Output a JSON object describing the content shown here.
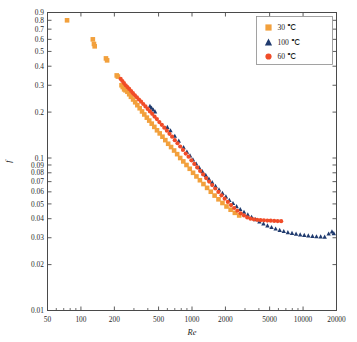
{
  "chart_data": {
    "type": "scatter",
    "title": "",
    "xlabel": "Re",
    "ylabel": "f",
    "xscale": "log",
    "yscale": "log",
    "xlim": [
      50,
      20000
    ],
    "ylim": [
      0.01,
      0.9
    ],
    "grid": false,
    "legend_position": "top-right",
    "xticks": [
      50,
      100,
      200,
      500,
      1000,
      2000,
      5000,
      10000,
      20000
    ],
    "xtick_labels": [
      "50",
      "100",
      "200",
      "500",
      "1000",
      "2000",
      "5000",
      "10000",
      "20000"
    ],
    "yticks": [
      0.01,
      0.02,
      0.03,
      0.04,
      0.05,
      0.06,
      0.07,
      0.08,
      0.09,
      0.1,
      0.2,
      0.3,
      0.4,
      0.5,
      0.6,
      0.7,
      0.8,
      0.9
    ],
    "ytick_labels": [
      "0.01",
      "0.02",
      "0.03",
      "0.04",
      "0.05",
      "0.06",
      "0.07",
      "0.08",
      "0.09",
      "0.1",
      "0.2",
      "0.3",
      "0.4",
      "0.5",
      "0.6",
      "0.7",
      "0.8",
      "0.9"
    ],
    "series": [
      {
        "name": "30 ℃",
        "marker": "square",
        "color": "#F2A03C",
        "points": [
          [
            75,
            0.8
          ],
          [
            128,
            0.6
          ],
          [
            131,
            0.56
          ],
          [
            133,
            0.54
          ],
          [
            168,
            0.45
          ],
          [
            172,
            0.437
          ],
          [
            210,
            0.348
          ],
          [
            215,
            0.342
          ],
          [
            232,
            0.3
          ],
          [
            238,
            0.292
          ],
          [
            245,
            0.282
          ],
          [
            252,
            0.278
          ],
          [
            262,
            0.272
          ],
          [
            272,
            0.262
          ],
          [
            282,
            0.252
          ],
          [
            295,
            0.242
          ],
          [
            308,
            0.232
          ],
          [
            322,
            0.222
          ],
          [
            338,
            0.212
          ],
          [
            355,
            0.202
          ],
          [
            372,
            0.193
          ],
          [
            392,
            0.184
          ],
          [
            412,
            0.176
          ],
          [
            434,
            0.168
          ],
          [
            458,
            0.16
          ],
          [
            484,
            0.152
          ],
          [
            512,
            0.145
          ],
          [
            542,
            0.138
          ],
          [
            575,
            0.131
          ],
          [
            610,
            0.124
          ],
          [
            648,
            0.118
          ],
          [
            690,
            0.112
          ],
          [
            735,
            0.106
          ],
          [
            783,
            0.1
          ],
          [
            835,
            0.095
          ],
          [
            892,
            0.09
          ],
          [
            954,
            0.085
          ],
          [
            1022,
            0.08
          ],
          [
            1096,
            0.0757
          ],
          [
            1178,
            0.0715
          ],
          [
            1268,
            0.0675
          ],
          [
            1367,
            0.0637
          ],
          [
            1477,
            0.0601
          ],
          [
            1598,
            0.0567
          ],
          [
            1732,
            0.0536
          ],
          [
            1880,
            0.0507
          ],
          [
            2045,
            0.0481
          ],
          [
            2228,
            0.0458
          ],
          [
            2432,
            0.0437
          ],
          [
            2660,
            0.042
          ]
        ]
      },
      {
        "name": "100 ℃",
        "marker": "triangle",
        "color": "#1F3A6E",
        "points": [
          [
            418,
            0.22
          ],
          [
            432,
            0.214
          ],
          [
            448,
            0.208
          ],
          [
            465,
            0.202
          ],
          [
            600,
            0.16
          ],
          [
            640,
            0.152
          ],
          [
            700,
            0.14
          ],
          [
            760,
            0.13
          ],
          [
            840,
            0.118
          ],
          [
            900,
            0.11
          ],
          [
            960,
            0.104
          ],
          [
            1020,
            0.098
          ],
          [
            1090,
            0.092
          ],
          [
            1160,
            0.087
          ],
          [
            1240,
            0.082
          ],
          [
            1330,
            0.0775
          ],
          [
            1420,
            0.0733
          ],
          [
            1520,
            0.0694
          ],
          [
            1630,
            0.0657
          ],
          [
            1750,
            0.0622
          ],
          [
            1880,
            0.059
          ],
          [
            2020,
            0.056
          ],
          [
            2170,
            0.0532
          ],
          [
            2340,
            0.0507
          ],
          [
            2520,
            0.0484
          ],
          [
            2720,
            0.0463
          ],
          [
            2940,
            0.0444
          ],
          [
            3180,
            0.0427
          ],
          [
            3440,
            0.0411
          ],
          [
            3730,
            0.0397
          ],
          [
            4050,
            0.0384
          ],
          [
            4400,
            0.0373
          ],
          [
            4780,
            0.0362
          ],
          [
            5200,
            0.0353
          ],
          [
            5660,
            0.0345
          ],
          [
            6160,
            0.0338
          ],
          [
            6700,
            0.0332
          ],
          [
            7300,
            0.0327
          ],
          [
            7950,
            0.0323
          ],
          [
            8650,
            0.0319
          ],
          [
            9420,
            0.0316
          ],
          [
            10250,
            0.0313
          ],
          [
            11150,
            0.0311
          ],
          [
            12150,
            0.0309
          ],
          [
            13200,
            0.0307
          ],
          [
            14400,
            0.0306
          ],
          [
            15650,
            0.0305
          ],
          [
            17000,
            0.032
          ],
          [
            18200,
            0.033
          ],
          [
            18900,
            0.0322
          ]
        ]
      },
      {
        "name": "60 ℃",
        "marker": "circle",
        "color": "#F04C28",
        "points": [
          [
            228,
            0.33
          ],
          [
            236,
            0.32
          ],
          [
            244,
            0.31
          ],
          [
            253,
            0.3
          ],
          [
            262,
            0.292
          ],
          [
            272,
            0.284
          ],
          [
            283,
            0.275
          ],
          [
            294,
            0.266
          ],
          [
            306,
            0.258
          ],
          [
            319,
            0.25
          ],
          [
            333,
            0.242
          ],
          [
            348,
            0.234
          ],
          [
            364,
            0.226
          ],
          [
            381,
            0.218
          ],
          [
            399,
            0.21
          ],
          [
            418,
            0.202
          ],
          [
            438,
            0.195
          ],
          [
            460,
            0.187
          ],
          [
            483,
            0.18
          ],
          [
            508,
            0.172
          ],
          [
            535,
            0.165
          ],
          [
            563,
            0.158
          ],
          [
            594,
            0.151
          ],
          [
            627,
            0.144
          ],
          [
            662,
            0.138
          ],
          [
            700,
            0.131
          ],
          [
            740,
            0.125
          ],
          [
            783,
            0.119
          ],
          [
            829,
            0.113
          ],
          [
            878,
            0.107
          ],
          [
            931,
            0.102
          ],
          [
            988,
            0.0965
          ],
          [
            1049,
            0.0915
          ],
          [
            1114,
            0.0868
          ],
          [
            1184,
            0.0823
          ],
          [
            1259,
            0.078
          ],
          [
            1340,
            0.0739
          ],
          [
            1427,
            0.0701
          ],
          [
            1520,
            0.0665
          ],
          [
            1620,
            0.0631
          ],
          [
            1728,
            0.0599
          ],
          [
            1844,
            0.0569
          ],
          [
            1968,
            0.0541
          ],
          [
            2102,
            0.0515
          ],
          [
            2246,
            0.0491
          ],
          [
            2400,
            0.047
          ],
          [
            2566,
            0.0451
          ],
          [
            2745,
            0.0434
          ],
          [
            2937,
            0.042
          ],
          [
            3143,
            0.0408
          ],
          [
            3365,
            0.04
          ],
          [
            3604,
            0.0396
          ],
          [
            3862,
            0.0393
          ],
          [
            4140,
            0.0391
          ],
          [
            4440,
            0.039
          ],
          [
            4765,
            0.0389
          ],
          [
            5115,
            0.0388
          ],
          [
            5495,
            0.0387
          ],
          [
            5905,
            0.0386
          ],
          [
            6350,
            0.0385
          ]
        ]
      }
    ]
  },
  "legend": {
    "entries": [
      {
        "label": "30 ℃",
        "marker": "square",
        "color": "#F2A03C"
      },
      {
        "label": "100 ℃",
        "marker": "triangle",
        "color": "#1F3A6E"
      },
      {
        "label": "60 ℃",
        "marker": "circle",
        "color": "#F04C28"
      }
    ]
  },
  "axis": {
    "x_title": "Re",
    "y_title": "f"
  },
  "colors": {
    "series_30c": "#F2A03C",
    "series_100c": "#1F3A6E",
    "series_60c": "#F04C28",
    "axis": "#4a4a4a",
    "background": "#ffffff"
  }
}
